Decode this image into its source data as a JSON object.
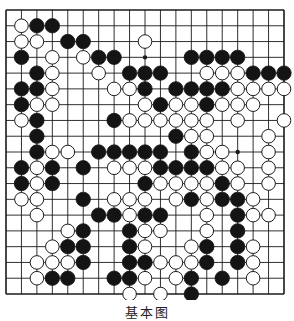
{
  "diagram": {
    "type": "go-board",
    "size": 19,
    "caption": "基本图",
    "colors": {
      "line": "#1a1a1a",
      "black_stone": "#141414",
      "white_stone": "#ffffff",
      "background": "#ffffff"
    },
    "star_points": [
      [
        3,
        3
      ],
      [
        3,
        9
      ],
      [
        3,
        15
      ],
      [
        9,
        3
      ],
      [
        9,
        9
      ],
      [
        9,
        15
      ],
      [
        15,
        3
      ],
      [
        15,
        9
      ],
      [
        15,
        15
      ]
    ],
    "stones": {
      "black": [
        [
          1,
          2
        ],
        [
          1,
          3
        ],
        [
          2,
          4
        ],
        [
          2,
          5
        ],
        [
          3,
          1
        ],
        [
          3,
          6
        ],
        [
          3,
          7
        ],
        [
          3,
          12
        ],
        [
          3,
          13
        ],
        [
          3,
          14
        ],
        [
          3,
          15
        ],
        [
          4,
          2
        ],
        [
          4,
          8
        ],
        [
          4,
          9
        ],
        [
          4,
          10
        ],
        [
          4,
          16
        ],
        [
          4,
          17
        ],
        [
          4,
          18
        ],
        [
          5,
          1
        ],
        [
          5,
          2
        ],
        [
          5,
          9
        ],
        [
          5,
          11
        ],
        [
          5,
          12
        ],
        [
          5,
          13
        ],
        [
          5,
          14
        ],
        [
          6,
          1
        ],
        [
          6,
          10
        ],
        [
          6,
          13
        ],
        [
          7,
          2
        ],
        [
          7,
          7
        ],
        [
          8,
          2
        ],
        [
          8,
          11
        ],
        [
          9,
          2
        ],
        [
          9,
          6
        ],
        [
          9,
          7
        ],
        [
          9,
          8
        ],
        [
          9,
          9
        ],
        [
          9,
          10
        ],
        [
          9,
          12
        ],
        [
          10,
          1
        ],
        [
          10,
          3
        ],
        [
          10,
          5
        ],
        [
          10,
          10
        ],
        [
          10,
          11
        ],
        [
          10,
          12
        ],
        [
          10,
          13
        ],
        [
          11,
          1
        ],
        [
          11,
          3
        ],
        [
          11,
          9
        ],
        [
          11,
          14
        ],
        [
          12,
          5
        ],
        [
          12,
          12
        ],
        [
          12,
          14
        ],
        [
          12,
          15
        ],
        [
          13,
          6
        ],
        [
          13,
          7
        ],
        [
          13,
          9
        ],
        [
          13,
          10
        ],
        [
          13,
          15
        ],
        [
          14,
          5
        ],
        [
          14,
          8
        ],
        [
          14,
          15
        ],
        [
          15,
          4
        ],
        [
          15,
          5
        ],
        [
          15,
          8
        ],
        [
          15,
          13
        ],
        [
          15,
          15
        ],
        [
          16,
          5
        ],
        [
          16,
          8
        ],
        [
          16,
          9
        ],
        [
          16,
          13
        ],
        [
          16,
          15
        ],
        [
          17,
          3
        ],
        [
          17,
          4
        ],
        [
          17,
          7
        ],
        [
          17,
          8
        ],
        [
          17,
          12
        ],
        [
          17,
          14
        ],
        [
          18,
          12
        ]
      ],
      "white": [
        [
          1,
          1
        ],
        [
          2,
          1
        ],
        [
          2,
          2
        ],
        [
          2,
          9
        ],
        [
          3,
          3
        ],
        [
          3,
          5
        ],
        [
          4,
          3
        ],
        [
          4,
          6
        ],
        [
          4,
          13
        ],
        [
          4,
          14
        ],
        [
          4,
          15
        ],
        [
          5,
          3
        ],
        [
          5,
          7
        ],
        [
          5,
          8
        ],
        [
          5,
          15
        ],
        [
          5,
          16
        ],
        [
          5,
          17
        ],
        [
          5,
          18
        ],
        [
          6,
          2
        ],
        [
          6,
          3
        ],
        [
          6,
          9
        ],
        [
          6,
          11
        ],
        [
          6,
          12
        ],
        [
          6,
          14
        ],
        [
          6,
          15
        ],
        [
          6,
          16
        ],
        [
          7,
          1
        ],
        [
          7,
          8
        ],
        [
          7,
          9
        ],
        [
          7,
          10
        ],
        [
          7,
          11
        ],
        [
          7,
          12
        ],
        [
          7,
          13
        ],
        [
          7,
          15
        ],
        [
          7,
          18
        ],
        [
          8,
          12
        ],
        [
          8,
          13
        ],
        [
          8,
          17
        ],
        [
          9,
          3
        ],
        [
          9,
          4
        ],
        [
          9,
          13
        ],
        [
          9,
          14
        ],
        [
          9,
          17
        ],
        [
          10,
          2
        ],
        [
          10,
          7
        ],
        [
          10,
          8
        ],
        [
          10,
          9
        ],
        [
          10,
          14
        ],
        [
          10,
          15
        ],
        [
          10,
          17
        ],
        [
          11,
          2
        ],
        [
          11,
          10
        ],
        [
          11,
          11
        ],
        [
          11,
          12
        ],
        [
          11,
          13
        ],
        [
          11,
          15
        ],
        [
          11,
          17
        ],
        [
          12,
          1
        ],
        [
          12,
          2
        ],
        [
          12,
          7
        ],
        [
          12,
          8
        ],
        [
          12,
          9
        ],
        [
          12,
          11
        ],
        [
          12,
          13
        ],
        [
          12,
          16
        ],
        [
          13,
          2
        ],
        [
          13,
          8
        ],
        [
          13,
          13
        ],
        [
          13,
          16
        ],
        [
          13,
          17
        ],
        [
          14,
          4
        ],
        [
          14,
          9
        ],
        [
          14,
          10
        ],
        [
          14,
          13
        ],
        [
          15,
          3
        ],
        [
          15,
          9
        ],
        [
          15,
          12
        ],
        [
          15,
          16
        ],
        [
          16,
          2
        ],
        [
          16,
          3
        ],
        [
          16,
          4
        ],
        [
          16,
          10
        ],
        [
          16,
          11
        ],
        [
          16,
          12
        ],
        [
          16,
          16
        ],
        [
          17,
          2
        ],
        [
          17,
          9
        ],
        [
          17,
          11
        ],
        [
          17,
          16
        ],
        [
          18,
          8
        ],
        [
          18,
          10
        ]
      ]
    },
    "geometry": {
      "x0": 6,
      "y0": 10,
      "x1": 284,
      "y1": 294,
      "stone_radius": 7.2
    }
  }
}
